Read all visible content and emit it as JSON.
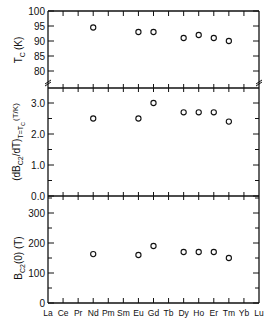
{
  "chart_data": [
    {
      "type": "scatter",
      "panel": "top",
      "ylabel": "T_C (K)",
      "ylabel_main": "T",
      "ylabel_sub": "C",
      "ylabel_unit": "(K)",
      "ylim": [
        77,
        100
      ],
      "axis_break": true,
      "yticks": [
        80,
        85,
        90,
        95,
        100
      ],
      "ytick_labels": [
        "80",
        "85",
        "90",
        "95",
        "100"
      ],
      "x": [
        "Nd",
        "Eu",
        "Gd",
        "Dy",
        "Ho",
        "Er",
        "Tm"
      ],
      "values": [
        94.5,
        93,
        93,
        91,
        92,
        91,
        90
      ],
      "marker": "open-circle"
    },
    {
      "type": "scatter",
      "panel": "middle",
      "ylabel": "(dB_C2/dT)_{T=T_C} (T/K)",
      "ylim": [
        0.0,
        3.5
      ],
      "yticks": [
        0.0,
        1.0,
        2.0,
        3.0
      ],
      "ytick_labels": [
        "0.0",
        "1.0",
        "2.0",
        "3.0"
      ],
      "x": [
        "Nd",
        "Eu",
        "Gd",
        "Dy",
        "Ho",
        "Er",
        "Tm"
      ],
      "values": [
        2.5,
        2.5,
        3.0,
        2.7,
        2.7,
        2.7,
        2.4
      ],
      "marker": "open-circle"
    },
    {
      "type": "scatter",
      "panel": "bottom",
      "ylabel": "B_C2(0) (T)",
      "ylim": [
        0,
        350
      ],
      "yticks": [
        0,
        100,
        200,
        300
      ],
      "ytick_labels": [
        "0",
        "100",
        "200",
        "300"
      ],
      "x": [
        "Nd",
        "Eu",
        "Gd",
        "Dy",
        "Ho",
        "Er",
        "Tm"
      ],
      "values": [
        163,
        160,
        190,
        170,
        170,
        170,
        150
      ],
      "marker": "open-circle"
    }
  ],
  "xaxis": {
    "categories": [
      "La",
      "Ce",
      "Pr",
      "Nd",
      "Pm",
      "Sm",
      "Eu",
      "Gd",
      "Tb",
      "Dy",
      "Ho",
      "Er",
      "Tm",
      "Yb",
      "Lu"
    ],
    "xlabel": ""
  },
  "labels": {
    "top_ylabel_main": "T",
    "top_ylabel_sub": "C",
    "top_ylabel_unit": "(K)",
    "mid_ylabel_open": "(dB",
    "mid_ylabel_sub": "C2",
    "mid_ylabel_mid": "/dT)",
    "mid_ylabel_sub2": "T=T",
    "mid_ylabel_sub3": "C",
    "mid_ylabel_unit": "(T/K)",
    "bot_ylabel_main": "B",
    "bot_ylabel_sub": "C2",
    "bot_ylabel_unit": "(0) (T)"
  }
}
